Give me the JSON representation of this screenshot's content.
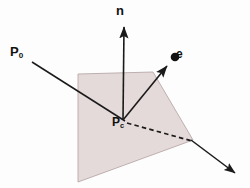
{
  "figure": {
    "type": "geometry-diagram",
    "background_color": "#fdfdfd",
    "plane": {
      "name": "shaded-plane-quadrilateral",
      "fill_color": "#e5dada",
      "stroke_color": "#b9a8a8",
      "points": "78,74 153,72 193,140 78,182"
    },
    "labels": {
      "normal": {
        "text": "n",
        "subscript": ""
      },
      "ray_origin": {
        "text": "P",
        "subscript": "0"
      },
      "intersection": {
        "text": "P",
        "subscript": "c"
      },
      "eye_vector": {
        "text": "e",
        "subscript": ""
      }
    },
    "vectors": {
      "normal_arrow": {
        "name": "normal-vector-n",
        "from": "123,120",
        "to": "124,24",
        "color": "#1a1a1a",
        "style": "solid"
      },
      "eye_arrow": {
        "name": "eye-vector-e",
        "from": "123,120",
        "to": "171,62",
        "color": "#1a1a1a",
        "style": "solid"
      },
      "eye_point_dot": {
        "name": "eye-point-dot",
        "center": "175,58",
        "radius": 4.2,
        "color": "#111111"
      },
      "incident_ray": {
        "name": "incident-ray-from-p0",
        "from": "32,62",
        "to": "123,120",
        "color": "#1a1a1a",
        "style": "solid"
      },
      "transmitted_ray_dashed": {
        "name": "transmitted-ray-dashed",
        "from": "126,122",
        "to": "193,141",
        "color": "#1a1a1a",
        "style": "dashed"
      },
      "transmitted_ray_solid": {
        "name": "transmitted-ray-solid",
        "from": "193,141",
        "to": "238,176",
        "color": "#1a1a1a",
        "style": "solid"
      }
    }
  }
}
